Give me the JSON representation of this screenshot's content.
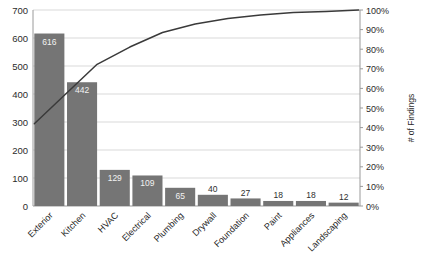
{
  "chart_data": {
    "type": "bar",
    "title": "",
    "subtitle": "",
    "xlabel": "",
    "ylabel": "",
    "y2label": "# of Findings",
    "categories": [
      "Exterior",
      "Kitchen",
      "HVAC",
      "Electrical",
      "Plumbing",
      "Drywall",
      "Foundation",
      "Paint",
      "Appliances",
      "Landscaping"
    ],
    "values": [
      616,
      442,
      129,
      109,
      65,
      40,
      27,
      18,
      18,
      12
    ],
    "value_labels": [
      "616",
      "442",
      "129",
      "109",
      "65",
      "40",
      "27",
      "18",
      "18",
      "12"
    ],
    "series": [
      {
        "name": "# of Findings",
        "type": "bar",
        "values": [
          616,
          442,
          129,
          109,
          65,
          40,
          27,
          18,
          18,
          12
        ]
      },
      {
        "name": "Cumulative %",
        "type": "line",
        "values": [
          42.0,
          72.3,
          81.1,
          88.5,
          92.9,
          95.7,
          97.5,
          98.7,
          99.2,
          100.0
        ]
      }
    ],
    "ylim": [
      0,
      700
    ],
    "yticks": [
      0,
      100,
      200,
      300,
      400,
      500,
      600,
      700
    ],
    "ytick_labels": [
      "0",
      "100",
      "200",
      "300",
      "400",
      "500",
      "600",
      "700"
    ],
    "y2lim": [
      0,
      100
    ],
    "y2ticks": [
      0,
      10,
      20,
      30,
      40,
      50,
      60,
      70,
      80,
      90,
      100
    ],
    "y2tick_labels": [
      "0%",
      "10%",
      "20%",
      "30%",
      "40%",
      "50%",
      "60%",
      "70%",
      "80%",
      "90%",
      "100%"
    ],
    "grid": true,
    "legend": "none",
    "bar_color": "#757575",
    "line_color": "#3a3a3a",
    "grid_color": "#d9d9d9",
    "axis_color": "#9a9a9a"
  }
}
